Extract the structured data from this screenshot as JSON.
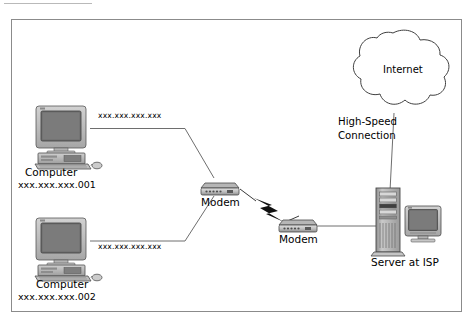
{
  "diagram": {
    "background_color": "#ffffff",
    "frame_color": "#8b8b8b",
    "line_color": "#6e6e6e",
    "text_color": "#000000",
    "nodes": {
      "computer1": {
        "icon": "desktop-computer-icon",
        "label": "Computer",
        "address": "xxx.xxx.xxx.001"
      },
      "computer2": {
        "icon": "desktop-computer-icon",
        "label": "Computer",
        "address": "xxx.xxx.xxx.002"
      },
      "modem1": {
        "icon": "modem-icon",
        "label": "Modem"
      },
      "modem2": {
        "icon": "modem-icon",
        "label": "Modem"
      },
      "server": {
        "icon": "server-tower-icon",
        "label": "Server at ISP"
      },
      "internet": {
        "icon": "cloud-icon",
        "label": "Internet"
      }
    },
    "connections": {
      "link1_label": "xxx.xxx.xxx.xxx",
      "link2_label": "xxx.xxx.xxx.xxx",
      "highspeed_label_line1": "High-Speed",
      "highspeed_label_line2": "Connection",
      "wireless_icon": "lightning-bolt-icon"
    }
  }
}
